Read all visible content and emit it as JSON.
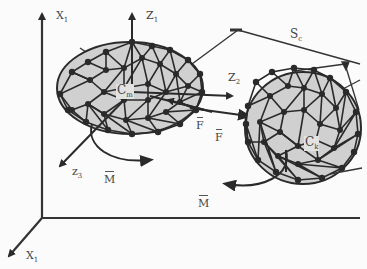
{
  "diagram": {
    "colors": {
      "mesh_fill": "#d0d0d0",
      "mesh_stroke": "#2a2a2a",
      "node": "#2a2a2a",
      "axis": "#333333",
      "label": "#444444",
      "background": "#fbfbfb"
    },
    "global_axes": {
      "vertical_label": "X",
      "vertical_sub": "1",
      "depth_label": "X",
      "depth_sub": "1"
    },
    "body_m": {
      "center_label": "C",
      "center_sub": "m",
      "axis_z1_label": "Z",
      "axis_z1_sub": "1",
      "axis_z2_label": "Z",
      "axis_z2_sub": "2",
      "axis_z3_label": "z",
      "axis_z3_sub": "3",
      "moment_label": "M"
    },
    "body_k": {
      "center_label": "C",
      "center_sub": "k",
      "moment_label": "M"
    },
    "forces": [
      {
        "label": "F"
      },
      {
        "label": "F"
      }
    ],
    "connector": {
      "label": "S",
      "sub": "c"
    }
  }
}
